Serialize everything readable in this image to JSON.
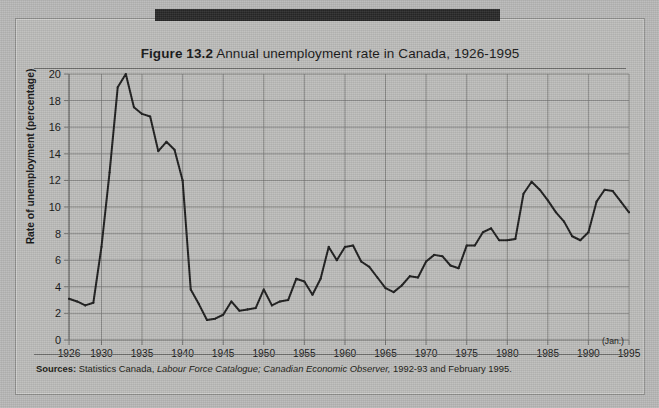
{
  "figure": {
    "number_label": "Figure 13.2",
    "title_text": "Annual unemployment rate in Canada, 1926-1995",
    "sources_label": "Sources:",
    "sources_part1": " Statistics Canada, ",
    "sources_italic1": "Labour Force Catalogue;",
    "sources_italic2": " Canadian Economic Observer,",
    "sources_part2": " 1992-93 and February 1995."
  },
  "axes": {
    "ylabel": "Rate of unemployment (percentage)",
    "xnote": "(Jan.)",
    "yticks": [
      0,
      2,
      4,
      6,
      8,
      10,
      12,
      14,
      16,
      18,
      20
    ],
    "xticks": [
      1926,
      1930,
      1935,
      1940,
      1945,
      1950,
      1955,
      1960,
      1965,
      1970,
      1975,
      1980,
      1985,
      1990,
      1995
    ]
  },
  "colors": {
    "paper": "#b8b8b7",
    "ink": "#141414",
    "grid": "#6f6f6d",
    "line": "#1b1b1b",
    "bar": "#272727"
  },
  "chart_data": {
    "type": "line",
    "title": "Figure 13.2 Annual unemployment rate in Canada, 1926-1995",
    "xlabel": "",
    "ylabel": "Rate of unemployment (percentage)",
    "xlim": [
      1926,
      1995
    ],
    "ylim": [
      0,
      20
    ],
    "grid": true,
    "legend": "none",
    "marker": "small-dot",
    "x": [
      1926,
      1927,
      1928,
      1929,
      1930,
      1931,
      1932,
      1933,
      1934,
      1935,
      1936,
      1937,
      1938,
      1939,
      1940,
      1941,
      1942,
      1943,
      1944,
      1945,
      1946,
      1947,
      1948,
      1949,
      1950,
      1951,
      1952,
      1953,
      1954,
      1955,
      1956,
      1957,
      1958,
      1959,
      1960,
      1961,
      1962,
      1963,
      1964,
      1965,
      1966,
      1967,
      1968,
      1969,
      1970,
      1971,
      1972,
      1973,
      1974,
      1975,
      1976,
      1977,
      1978,
      1979,
      1980,
      1981,
      1982,
      1983,
      1984,
      1985,
      1986,
      1987,
      1988,
      1989,
      1990,
      1991,
      1992,
      1993,
      1994,
      1995
    ],
    "values": [
      3.1,
      2.9,
      2.6,
      2.8,
      7.0,
      12.6,
      19.0,
      20.0,
      17.5,
      17.0,
      16.8,
      14.2,
      14.9,
      14.3,
      12.0,
      3.8,
      2.7,
      1.5,
      1.6,
      1.9,
      2.9,
      2.2,
      2.3,
      2.4,
      3.8,
      2.6,
      2.9,
      3.0,
      4.6,
      4.4,
      3.4,
      4.6,
      7.0,
      6.0,
      7.0,
      7.1,
      5.9,
      5.5,
      4.7,
      3.9,
      3.6,
      4.1,
      4.8,
      4.7,
      5.9,
      6.4,
      6.3,
      5.6,
      5.4,
      7.1,
      7.1,
      8.1,
      8.4,
      7.5,
      7.5,
      7.6,
      11.0,
      11.9,
      11.3,
      10.5,
      9.6,
      8.9,
      7.8,
      7.5,
      8.1,
      10.4,
      11.3,
      11.2,
      10.4,
      9.6
    ],
    "units": "percent",
    "series_name": "Annual unemployment rate, Canada"
  }
}
